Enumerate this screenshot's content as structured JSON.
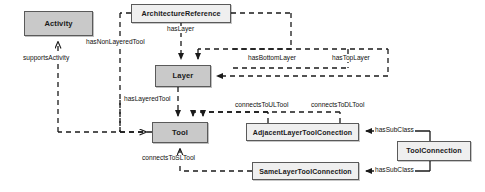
{
  "diagram": {
    "background_color": "#ffffff",
    "edge_color": "#1a1a1a",
    "node_border_color": "#5a5a5a",
    "node_fill_dark": "#c9c9c9",
    "node_fill_light": "#efefef",
    "nodes": [
      {
        "id": "activity",
        "label": "Activity",
        "fill": "dark",
        "x": 24,
        "y": 11,
        "w": 69,
        "h": 25
      },
      {
        "id": "architecture_reference",
        "label": "ArchitectureReference",
        "fill": "light",
        "x": 131,
        "y": 4,
        "w": 100,
        "h": 19
      },
      {
        "id": "layer",
        "label": "Layer",
        "fill": "dark",
        "x": 155,
        "y": 65,
        "w": 56,
        "h": 22
      },
      {
        "id": "tool",
        "label": "Tool",
        "fill": "dark",
        "x": 152,
        "y": 122,
        "w": 56,
        "h": 21
      },
      {
        "id": "adjacent_layer_tool_conection",
        "label": "AdjacentLayerToolConection",
        "fill": "light",
        "x": 246,
        "y": 123,
        "w": 113,
        "h": 18
      },
      {
        "id": "same_layer_tool_connection",
        "label": "SameLayerToolConnection",
        "fill": "light",
        "x": 252,
        "y": 162,
        "w": 107,
        "h": 18
      },
      {
        "id": "tool_connection",
        "label": "ToolConnection",
        "fill": "light",
        "x": 397,
        "y": 141,
        "w": 74,
        "h": 20
      }
    ],
    "edge_labels": [
      {
        "id": "supports_activity",
        "text": "supportsActivity",
        "x": 22,
        "y": 60,
        "size": 6.6
      },
      {
        "id": "has_non_layered_tool",
        "text": "hasNonLayeredTool",
        "x": 85,
        "y": 44,
        "size": 6.6
      },
      {
        "id": "has_layer",
        "text": "hasLayer",
        "x": 166,
        "y": 31,
        "size": 6.6
      },
      {
        "id": "has_bottom_layer",
        "text": "hasBottomLayer",
        "x": 247,
        "y": 58,
        "size": 6.6
      },
      {
        "id": "has_top_layer",
        "text": "hasTopLayer",
        "x": 331,
        "y": 58,
        "size": 6.6
      },
      {
        "id": "has_layered_tool",
        "text": "hasLayeredTool",
        "x": 123,
        "y": 99,
        "size": 6.6
      },
      {
        "id": "connects_to_ul_tool",
        "text": "connectsToULTool",
        "x": 236,
        "y": 105,
        "size": 6.6
      },
      {
        "id": "connects_to_dl_tool",
        "text": "connectsToDLTool",
        "x": 312,
        "y": 105,
        "size": 6.6
      },
      {
        "id": "connects_to_sl_tool",
        "text": "connectsToSLTool",
        "x": 141,
        "y": 158,
        "size": 6.6
      },
      {
        "id": "has_sub_class_upper",
        "text": "hasSubClass",
        "x": 376,
        "y": 128,
        "size": 6.6
      },
      {
        "id": "has_sub_class_lower",
        "text": "hasSubClass",
        "x": 376,
        "y": 167,
        "size": 6.6
      }
    ],
    "relations": [
      {
        "id": "supportsActivity",
        "from": "tool",
        "to": "activity",
        "style": "dashed",
        "arrow": "open"
      },
      {
        "id": "hasNonLayeredTool",
        "from": "architecture_reference",
        "to": "tool",
        "style": "dashed",
        "arrow": "open"
      },
      {
        "id": "hasLayer",
        "from": "architecture_reference",
        "to": "layer",
        "style": "dashed",
        "arrow": "filled"
      },
      {
        "id": "hasBottomLayer",
        "from": "architecture_reference",
        "to": "layer",
        "style": "dashed",
        "arrow": "filled"
      },
      {
        "id": "hasTopLayer",
        "from": "architecture_reference",
        "to": "layer",
        "style": "dashed",
        "arrow": "filled"
      },
      {
        "id": "hasLayeredTool",
        "from": "layer",
        "to": "tool",
        "style": "dashed",
        "arrow": "filled"
      },
      {
        "id": "connectsToULTool",
        "from": "adjacent_layer_tool_conection",
        "to": "tool",
        "style": "dashed",
        "arrow": "filled"
      },
      {
        "id": "connectsToDLTool",
        "from": "adjacent_layer_tool_conection",
        "to": "tool",
        "style": "dashed",
        "arrow": "filled"
      },
      {
        "id": "connectsToSLTool",
        "from": "same_layer_tool_connection",
        "to": "tool",
        "style": "dashed",
        "arrow": "open"
      },
      {
        "id": "hasSubClassAdjacent",
        "from": "tool_connection",
        "to": "adjacent_layer_tool_conection",
        "style": "solid",
        "arrow": "filled"
      },
      {
        "id": "hasSubClassSame",
        "from": "tool_connection",
        "to": "same_layer_tool_connection",
        "style": "solid",
        "arrow": "filled"
      }
    ]
  }
}
